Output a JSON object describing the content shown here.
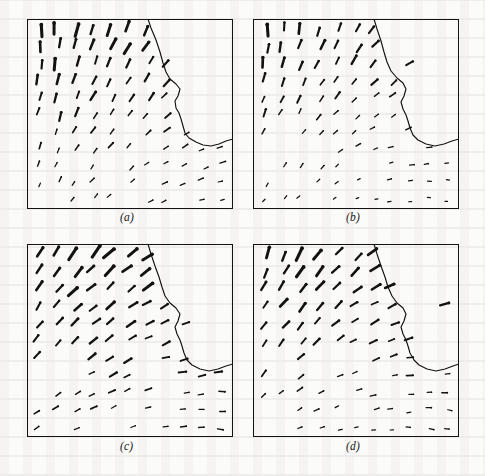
{
  "figure": {
    "kind": "vector-field-panel-grid",
    "background_color": "#fbfbf9",
    "ink_color": "#121212",
    "rows": 2,
    "cols": 2
  },
  "panels": [
    {
      "id": "a",
      "caption": "(a)",
      "frame": {
        "x": 27,
        "y": 19,
        "w": 206,
        "h": 190
      },
      "caption_y": 211,
      "contour": "M 148 19 L 151 28 L 156 40 L 160 52 L 163 63 L 166 72 L 170 79 L 176 84 L 180 89 L 178 96 L 175 101 L 176 108 L 179 113 L 181 119 L 183 126 L 185 133 L 189 138 L 196 142 L 203 145 L 211 146 L 219 144 L 226 141 L 233 139",
      "contour_width": 1.15,
      "glyph_scale": 1.0,
      "angle_model": {
        "base_deg": -90,
        "x_gain_deg": 46,
        "y_gain_deg": 30,
        "noise_deg": 7
      },
      "length_model": {
        "top": 11.5,
        "bottom": 4.0,
        "edge_falloff": 0.55
      },
      "seed": 11
    },
    {
      "id": "b",
      "caption": "(b)",
      "frame": {
        "x": 253,
        "y": 19,
        "w": 206,
        "h": 190
      },
      "caption_y": 211,
      "contour": "M 374 19 L 377 29 L 381 41 L 384 52 L 387 62 L 391 71 L 397 78 L 403 83 L 406 89 L 404 96 L 401 102 L 403 109 L 406 115 L 408 121 L 410 128 L 413 135 L 418 140 L 426 144 L 435 146 L 444 144 L 452 141 L 459 139",
      "contour_width": 1.15,
      "glyph_scale": 0.92,
      "angle_model": {
        "base_deg": -90,
        "x_gain_deg": 58,
        "y_gain_deg": 38,
        "noise_deg": 9
      },
      "length_model": {
        "top": 11.0,
        "bottom": 3.4,
        "edge_falloff": 0.6
      },
      "seed": 27
    },
    {
      "id": "c",
      "caption": "(c)",
      "frame": {
        "x": 27,
        "y": 244,
        "w": 206,
        "h": 193
      },
      "caption_y": 440,
      "contour": "M 148 244 L 151 254 L 155 266 L 159 277 L 162 287 L 165 296 L 170 303 L 176 308 L 180 314 L 178 321 L 175 327 L 177 334 L 180 340 L 182 346 L 184 353 L 187 360 L 192 365 L 200 369 L 209 371 L 218 369 L 226 366 L 233 364",
      "contour_width": 1.15,
      "glyph_scale": 1.05,
      "angle_model": {
        "base_deg": -62,
        "x_gain_deg": 40,
        "y_gain_deg": 26,
        "noise_deg": 8
      },
      "length_model": {
        "top": 12.0,
        "bottom": 4.6,
        "edge_falloff": 0.5
      },
      "seed": 43
    },
    {
      "id": "d",
      "caption": "(d)",
      "frame": {
        "x": 253,
        "y": 244,
        "w": 206,
        "h": 193
      },
      "caption_y": 440,
      "contour": "M 374 244 L 377 254 L 381 266 L 385 277 L 388 287 L 392 296 L 397 303 L 403 308 L 406 314 L 404 321 L 401 327 L 403 334 L 406 340 L 408 346 L 410 353 L 414 360 L 419 365 L 427 369 L 436 371 L 445 369 L 453 366 L 459 364",
      "contour_width": 1.15,
      "glyph_scale": 1.0,
      "angle_model": {
        "base_deg": -68,
        "x_gain_deg": 48,
        "y_gain_deg": 30,
        "noise_deg": 8
      },
      "length_model": {
        "top": 11.5,
        "bottom": 4.0,
        "edge_falloff": 0.55
      },
      "seed": 59
    }
  ],
  "grid": {
    "cols": 11,
    "rows": 11,
    "margin_x": 12,
    "margin_y": 10,
    "jitter": 3.2
  },
  "chart_data": {
    "type": "scatter",
    "title": "",
    "xlabel": "",
    "ylabel": "",
    "subplots": [
      "(a)",
      "(b)",
      "(c)",
      "(d)"
    ],
    "legend": [],
    "grid": false
  }
}
